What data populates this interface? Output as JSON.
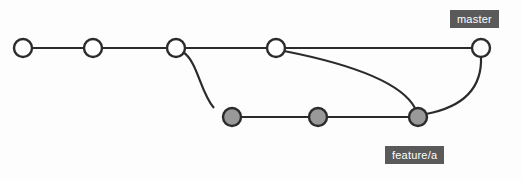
{
  "diagram": {
    "type": "commit-graph",
    "width": 522,
    "height": 180,
    "background_color": "#fdfdfd",
    "stroke_color": "#2b2b2b",
    "stroke_width": 2.2,
    "node_radius": 9,
    "branches": [
      {
        "id": "master",
        "label": "master",
        "label_background": "#5a5a5a",
        "label_color": "#ffffff",
        "label_x": 450,
        "label_y": 10,
        "node_fill": "#ffffff",
        "lane_y": 48,
        "commits": [
          {
            "id": "m1",
            "x": 23,
            "y": 48
          },
          {
            "id": "m2",
            "x": 93,
            "y": 48
          },
          {
            "id": "m3",
            "x": 176,
            "y": 48
          },
          {
            "id": "m4",
            "x": 276,
            "y": 48
          },
          {
            "id": "m5",
            "x": 481,
            "y": 48
          }
        ]
      },
      {
        "id": "feature-a",
        "label": "feature/a",
        "label_background": "#5a5a5a",
        "label_color": "#ffffff",
        "label_x": 385,
        "label_y": 146,
        "node_fill": "#999999",
        "lane_y": 117,
        "commits": [
          {
            "id": "f1",
            "x": 232,
            "y": 117
          },
          {
            "id": "f2",
            "x": 318,
            "y": 117
          },
          {
            "id": "f3",
            "x": 418,
            "y": 117
          }
        ]
      }
    ],
    "edges": [
      {
        "from": "m1",
        "to": "m2",
        "kind": "straight",
        "path": "M 32 48 L 84 48"
      },
      {
        "from": "m2",
        "to": "m3",
        "kind": "straight",
        "path": "M 102 48 L 167 48"
      },
      {
        "from": "m3",
        "to": "m4",
        "kind": "straight",
        "path": "M 185 48 L 267 48"
      },
      {
        "from": "m4",
        "to": "m5",
        "kind": "straight",
        "path": "M 285 48 L 472 48"
      },
      {
        "from": "m3",
        "to": "f1",
        "kind": "branch-curve",
        "path": "M 183 52 C 198 62 200 92 214 108"
      },
      {
        "from": "f1",
        "to": "f2",
        "kind": "straight",
        "path": "M 241 117 L 309 117"
      },
      {
        "from": "f2",
        "to": "f3",
        "kind": "straight",
        "path": "M 327 117 L 409 117"
      },
      {
        "from": "m4",
        "to": "f3",
        "kind": "merge-curve",
        "path": "M 284 51 C 340 62 400 80 415 108"
      },
      {
        "from": "f3",
        "to": "m5",
        "kind": "merge-back-curve",
        "path": "M 426 114 C 468 106 482 84 481 57"
      }
    ]
  }
}
